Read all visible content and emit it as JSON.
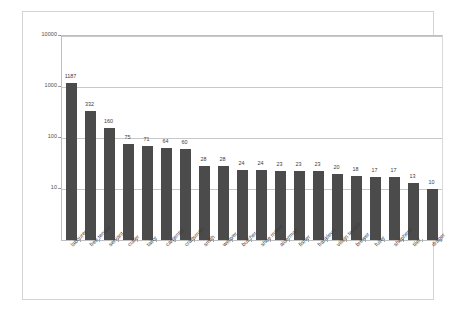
{
  "chart_data": {
    "type": "bar",
    "title": "",
    "subtitle": "",
    "xlabel": "",
    "ylabel": "",
    "scale": "log",
    "grid": true,
    "legend": "none",
    "ylim": [
      1,
      10000
    ],
    "ytick_labels": [
      "10000",
      "1000",
      "100",
      "10"
    ],
    "ytick_values": [
      10000,
      1000,
      100,
      10
    ],
    "categories": [
      "labourer",
      "free tenant",
      "servant",
      "cutler",
      "tailor",
      "carpenter",
      "craftsman",
      "smith",
      "weaver",
      "butcher",
      "shoe maker",
      "alderman",
      "fisher",
      "frankleyn",
      "villein tenant",
      "brewer",
      "fuller",
      "shepherd",
      "tiler",
      "draper"
    ],
    "values": [
      1187,
      332,
      160,
      75,
      71,
      64,
      60,
      28,
      28,
      24,
      24,
      23,
      23,
      23,
      20,
      18,
      17,
      17,
      13,
      10
    ],
    "bar_color": "#4b4b4b",
    "grid_color": "#c8c8c8",
    "frame_color": "#d4d4d4"
  }
}
